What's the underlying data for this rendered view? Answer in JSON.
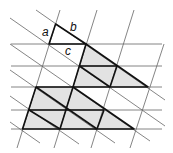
{
  "diagram": {
    "labels": {
      "a": "a",
      "b": "b",
      "c": "c"
    },
    "colors": {
      "background": "#ffffff",
      "thin_line": "#555555",
      "thick_line": "#111111",
      "shade": "#e2e2e2"
    },
    "lattice": {
      "row_y": [
        44,
        66,
        87,
        110,
        129
      ],
      "horizontal_extent_x": [
        11,
        162
      ],
      "basis_u": [
        37.3,
        0
      ],
      "basis_v": [
        -6.6,
        21.3
      ],
      "origin": [
        49,
        44
      ]
    },
    "unit_triangle": {
      "vertices": [
        [
          55.6,
          24
        ],
        [
          49,
          44
        ],
        [
          86,
          44
        ]
      ],
      "side_labels": [
        "a",
        "b",
        "c"
      ]
    },
    "shaded_regions": [
      {
        "name": "upper-triangle",
        "vertices": [
          [
            86,
            44
          ],
          [
            73,
            87
          ],
          [
            148,
            87
          ]
        ]
      },
      {
        "name": "lower-trapezoid",
        "vertices": [
          [
            36,
            87
          ],
          [
            73,
            87
          ],
          [
            134,
            129
          ],
          [
            22.5,
            129
          ]
        ]
      }
    ]
  }
}
